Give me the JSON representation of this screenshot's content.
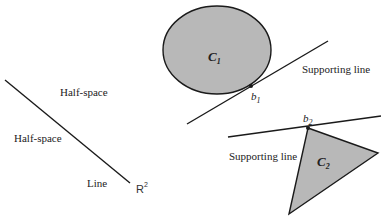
{
  "figure": {
    "colors": {
      "stroke": "#1a1a1a",
      "fill": "#b8b8b8",
      "background": "#ffffff"
    },
    "left_panel": {
      "line": {
        "x1": 5,
        "y1": 80,
        "x2": 130,
        "y2": 183
      },
      "labels": {
        "half_space_upper": "Half-space",
        "half_space_lower": "Half-space",
        "line": "Line",
        "space": "R",
        "space_exp": "2"
      }
    },
    "right_panel": {
      "set_c1": {
        "label": "C",
        "subscript": "1",
        "ellipse": {
          "cx": 217,
          "cy": 50,
          "rx": 54,
          "ry": 44
        }
      },
      "supporting_line_1": {
        "label": "Supporting line",
        "x1": 187,
        "y1": 124,
        "x2": 328,
        "y2": 41
      },
      "point_b1": {
        "label": "b",
        "subscript": "1",
        "x": 251,
        "y": 83
      },
      "set_c2": {
        "label": "C",
        "subscript": "2",
        "points": [
          [
            308,
            128
          ],
          [
            378,
            153
          ],
          [
            289,
            214
          ]
        ]
      },
      "supporting_line_2": {
        "label": "Supporting line",
        "x1": 228,
        "y1": 137,
        "x2": 381,
        "y2": 116
      },
      "point_b2": {
        "label": "b",
        "subscript": "2",
        "x": 308,
        "y": 128
      }
    }
  }
}
